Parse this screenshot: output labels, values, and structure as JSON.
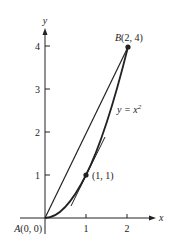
{
  "diagram": {
    "axes": {
      "x_label": "x",
      "y_label": "y",
      "x_ticks": [
        "1",
        "2"
      ],
      "y_ticks": [
        "1",
        "2",
        "3",
        "4"
      ]
    },
    "points": {
      "A": {
        "name": "A",
        "coords": "(0, 0)"
      },
      "B": {
        "name": "B",
        "coords": "(2, 4)"
      },
      "P": {
        "coords": "(1, 1)"
      }
    },
    "curve_label": {
      "lhs": "y = x",
      "exp": "2"
    },
    "colors": {
      "ink": "#222222",
      "background": "#ffffff"
    }
  }
}
